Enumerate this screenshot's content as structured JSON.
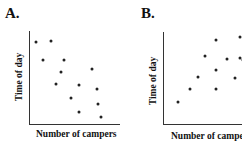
{
  "chart_data": [
    {
      "type": "scatter",
      "panel": "A.",
      "title": "A.",
      "xlabel": "Number of campers",
      "ylabel": "Time of day",
      "grid": false,
      "ticks": false,
      "xlim": [
        0,
        10
      ],
      "ylim": [
        0,
        10
      ],
      "trend": "negative",
      "points": [
        {
          "x": 0.8,
          "y": 8.8
        },
        {
          "x": 2.4,
          "y": 8.9
        },
        {
          "x": 1.5,
          "y": 6.9
        },
        {
          "x": 3.9,
          "y": 6.9
        },
        {
          "x": 3.6,
          "y": 5.6
        },
        {
          "x": 7.0,
          "y": 5.9
        },
        {
          "x": 3.0,
          "y": 4.3
        },
        {
          "x": 5.6,
          "y": 4.2
        },
        {
          "x": 7.6,
          "y": 3.8
        },
        {
          "x": 4.7,
          "y": 2.8
        },
        {
          "x": 7.7,
          "y": 2.1
        },
        {
          "x": 5.5,
          "y": 1.3
        },
        {
          "x": 8.0,
          "y": 0.7
        }
      ]
    },
    {
      "type": "scatter",
      "panel": "B.",
      "title": "B.",
      "xlabel": "Number of campers",
      "ylabel": "Time of day",
      "grid": false,
      "ticks": false,
      "xlim": [
        0,
        10
      ],
      "ylim": [
        0,
        10
      ],
      "trend": "positive",
      "points": [
        {
          "x": 1.7,
          "y": 2.4
        },
        {
          "x": 3.0,
          "y": 3.8
        },
        {
          "x": 3.9,
          "y": 5.1
        },
        {
          "x": 5.9,
          "y": 3.8
        },
        {
          "x": 5.9,
          "y": 5.9
        },
        {
          "x": 4.7,
          "y": 7.4
        },
        {
          "x": 5.9,
          "y": 9.1
        },
        {
          "x": 7.1,
          "y": 7.1
        },
        {
          "x": 8.0,
          "y": 5.0
        },
        {
          "x": 8.5,
          "y": 7.2
        },
        {
          "x": 8.5,
          "y": 9.5
        },
        {
          "x": 8.9,
          "y": 7.0
        }
      ]
    }
  ],
  "panels": {
    "a": {
      "label": "A.",
      "xlabel": "Number of campers",
      "ylabel": "Time of day"
    },
    "b": {
      "label": "B.",
      "xlabel": "Number of campers",
      "ylabel": "Time of day"
    }
  }
}
